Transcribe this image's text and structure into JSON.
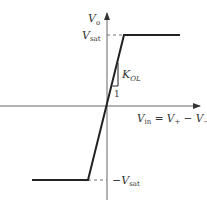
{
  "diagram": {
    "y_axis": {
      "label": "V",
      "label_sub": "o"
    },
    "x_axis": {
      "label": "V",
      "label_sub": "in",
      "eq": " = V",
      "plus_sub": "+",
      "minus": " − V",
      "minus_sub": "−"
    },
    "upper_level": {
      "label": "V",
      "label_sub": "sat"
    },
    "lower_level": {
      "label": "−V",
      "label_sub": "sat"
    },
    "slope": {
      "label": "K",
      "label_sub": "OL",
      "run_label": "1"
    },
    "colors": {
      "line": "#222222",
      "axis": "#555555",
      "dash": "#777777"
    }
  }
}
